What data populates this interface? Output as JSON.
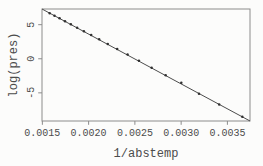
{
  "chart_data": {
    "type": "scatter",
    "title": "",
    "xlabel": "1/abstemp",
    "ylabel": "log(pres)",
    "x": [
      0.0015794,
      0.0016309,
      0.0016859,
      0.0017448,
      0.0018079,
      0.0018758,
      0.001949,
      0.002028,
      0.0021138,
      0.002207,
      0.0023089,
      0.0024208,
      0.0025441,
      0.0026809,
      0.0028328,
      0.0030017,
      0.0031928,
      0.0034111,
      0.0036609
    ],
    "y": [
      6.6921,
      6.3244,
      5.9296,
      5.5094,
      5.0562,
      4.5643,
      4.0431,
      3.4689,
      2.8507,
      2.1748,
      1.4351,
      0.6152,
      -0.2877,
      -1.3093,
      -2.4079,
      -3.5066,
      -5.116,
      -6.7254,
      -8.5172
    ],
    "fit_line": {
      "slope": -7307.4,
      "intercept": 18.233
    },
    "xlim": [
      0.0014961,
      0.0037442
    ],
    "ylim": [
      -9.128,
      7.301
    ],
    "xticks": [
      0.0015,
      0.002,
      0.0025,
      0.003,
      0.0035
    ],
    "xtick_labels": [
      "0.0015",
      "0.0020",
      "0.0025",
      "0.0030",
      "0.0035"
    ],
    "yticks": [
      -5,
      0,
      5
    ],
    "ytick_labels": [
      "-5",
      "0",
      "5"
    ],
    "grid": false,
    "legend": null,
    "marker": "dot",
    "colors": {
      "background": "#fcfcfb",
      "box": "#8c8c8c",
      "line": "#4c4c4c",
      "marker": "#303030",
      "text": "#4c4c4c"
    }
  }
}
